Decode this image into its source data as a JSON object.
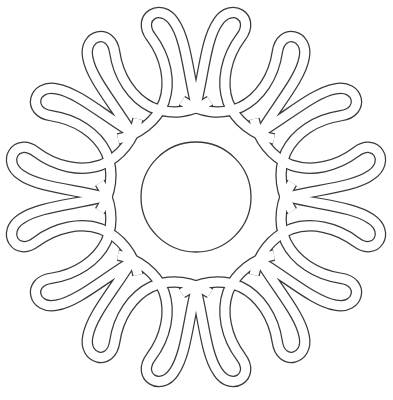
{
  "artwork": {
    "kind": "line-art coloring page",
    "subject": "celtic knot mandala with teardrop loops around a central circle",
    "colors": {
      "line": "#3a3a3a",
      "background": "#ffffff"
    },
    "center": {
      "x": 196,
      "y": 197
    },
    "center_circle_radius": 55,
    "motif_count": 8,
    "loops_per_motif": 2,
    "total_loops": 16
  }
}
